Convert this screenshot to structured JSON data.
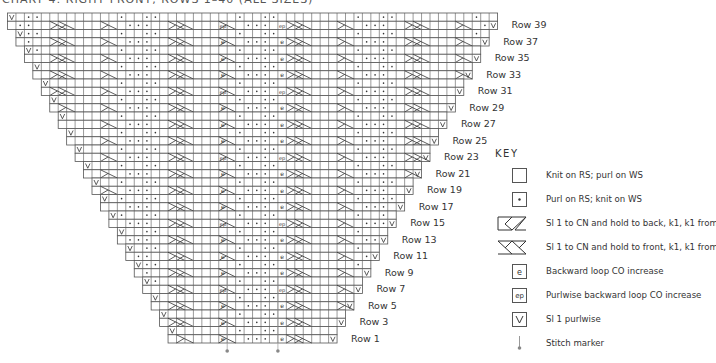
{
  "title": "CHART 4: RIGHT FRONT, ROWS 1–40 (ALL SIZES)",
  "chart": {
    "rows_total": 40,
    "row1_stitches": 20,
    "row40_stitches": 58,
    "increase_per_side_every_rows": 2,
    "row_labels": [
      "Row 1",
      "Row 3",
      "Row 5",
      "Row 7",
      "Row 9",
      "Row 11",
      "Row 13",
      "Row 15",
      "Row 17",
      "Row 19",
      "Row 21",
      "Row 23",
      "Row 25",
      "Row 27",
      "Row 29",
      "Row 31",
      "Row 33",
      "Row 35",
      "Row 37",
      "Row 39"
    ],
    "stitch_markers": 2,
    "colors": {
      "grid": "#555555",
      "symbol": "#333333",
      "background": "#ffffff"
    }
  },
  "key": {
    "heading": "Key",
    "items": [
      {
        "symbol": "knit-box",
        "label": "Knit on RS; purl on WS"
      },
      {
        "symbol": "purl-dot",
        "label": "Purl on RS; knit on WS"
      },
      {
        "symbol": "cable-back",
        "label": "Sl 1 to CN and hold to back, k1, k1 from CN"
      },
      {
        "symbol": "cable-front",
        "label": "Sl 1 to CN and hold to front, k1, k1 from CN"
      },
      {
        "symbol": "backward-loop-e",
        "label": "Backward loop CO increase"
      },
      {
        "symbol": "purlwise-loop-ep",
        "label": "Purlwise backward loop CO increase"
      },
      {
        "symbol": "slip-v",
        "label": "Sl 1 purlwise"
      },
      {
        "symbol": "stitch-marker",
        "label": "Stitch marker"
      }
    ]
  }
}
